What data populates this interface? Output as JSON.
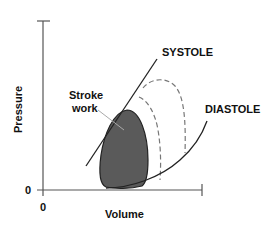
{
  "diagram": {
    "y_axis_label": "Pressure",
    "x_axis_label": "Volume",
    "y_origin_tick": "0",
    "x_origin_tick": "0",
    "curves": [
      {
        "label": "SYSTOLE",
        "style": "solid line"
      },
      {
        "label": "DIASTOLE",
        "style": "solid curve"
      }
    ],
    "shaded_region_label_line1": "Stroke",
    "shaded_region_label_line2": "work",
    "colors": {
      "loop_fill": "#5a5a5a",
      "line": "#222222",
      "axis": "#555555",
      "dashed": "#777777"
    }
  }
}
